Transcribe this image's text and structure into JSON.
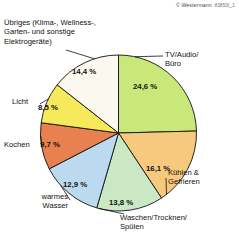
{
  "copyright": {
    "notice": "© Westermann",
    "code": "83850(_1"
  },
  "chart_data": {
    "type": "pie",
    "title": "",
    "subtitle": "",
    "xlabel": "",
    "ylabel": "",
    "legend_position": "callout-labels",
    "grid": false,
    "unit": "%",
    "decimal_separator": ",",
    "start_angle_deg": 0,
    "direction": "clockwise",
    "categories": [
      "TV/Audio/\nBüro",
      "Kühlen &\nGefrieren",
      "Waschen/Trocknen/\nSpülen",
      "warmes\nWasser",
      "Kochen",
      "Licht",
      "Übriges (Klima-, Wellness-,\nGarten- und sonstige\nElektrogeräte)"
    ],
    "values": [
      24.6,
      16.1,
      13.8,
      12.9,
      9.7,
      8.5,
      14.4
    ],
    "value_labels": [
      "24,6 %",
      "16,1 %",
      "13,8 %",
      "12,9 %",
      "9,7 %",
      "8,5 %",
      "14,4 %"
    ],
    "colors": [
      "#c9e87a",
      "#f6c97e",
      "#c9e8c3",
      "#bbd9ef",
      "#e8804f",
      "#f6ea5c",
      "#fbf9ef"
    ],
    "slices": [
      {
        "label": "TV/Audio/Büro",
        "label_line1": "TV/Audio/",
        "label_line2": "Büro",
        "value": 24.6,
        "value_label": "24,6 %",
        "color": "#c9e87a"
      },
      {
        "label": "Kühlen & Gefrieren",
        "label_line1": "Kühlen &",
        "label_line2": "Gefrieren",
        "value": 16.1,
        "value_label": "16,1 %",
        "color": "#f6c97e"
      },
      {
        "label": "Waschen/Trocknen/Spülen",
        "label_line1": "Waschen/Trocknen/",
        "label_line2": "Spülen",
        "value": 13.8,
        "value_label": "13,8 %",
        "color": "#c9e8c3"
      },
      {
        "label": "warmes Wasser",
        "label_line1": "warmes",
        "label_line2": "Wasser",
        "value": 12.9,
        "value_label": "12,9 %",
        "color": "#bbd9ef"
      },
      {
        "label": "Kochen",
        "label_line1": "Kochen",
        "label_line2": "",
        "value": 9.7,
        "value_label": "9,7 %",
        "color": "#e8804f"
      },
      {
        "label": "Licht",
        "label_line1": "Licht",
        "label_line2": "",
        "value": 8.5,
        "value_label": "8,5 %",
        "color": "#f6ea5c"
      },
      {
        "label": "Übriges (Klima-, Wellness-, Garten- und sonstige Elektrogeräte)",
        "label_line1": "Übriges (Klima-, Wellness-,",
        "label_line2": "Garten- und sonstige",
        "label_line3": "Elektrogeräte)",
        "value": 14.4,
        "value_label": "14,4 %",
        "color": "#fbf9ef"
      }
    ]
  }
}
